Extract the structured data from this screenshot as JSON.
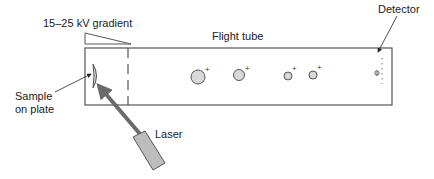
{
  "labels": {
    "gradient": "15–25 kV gradient",
    "flight_tube": "Flight tube",
    "detector": "Detector",
    "sample_line1": "Sample",
    "sample_line2": "on plate",
    "laser": "Laser"
  },
  "ions": [
    {
      "cx": 198,
      "cy": 77,
      "r": 7,
      "charge": "+"
    },
    {
      "cx": 239,
      "cy": 75,
      "r": 5.5,
      "charge": "+"
    },
    {
      "cx": 288,
      "cy": 76,
      "r": 4,
      "charge": "+"
    },
    {
      "cx": 313,
      "cy": 75,
      "r": 4,
      "charge": "+"
    }
  ],
  "colors": {
    "stroke": "#555555",
    "ion_fill": "#d8d8d8",
    "laser_fill": "#bdbdbd",
    "beam": "#6a6a6a"
  }
}
